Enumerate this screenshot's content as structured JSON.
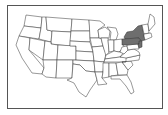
{
  "map": {
    "type": "US states outline map",
    "highlighted_region": "Mid-Atlantic",
    "highlighted_states": [
      "New York",
      "Pennsylvania",
      "New Jersey"
    ],
    "highlight_color": "#6e6e6e",
    "base_color": "#ffffff",
    "border_color": "#333333"
  }
}
